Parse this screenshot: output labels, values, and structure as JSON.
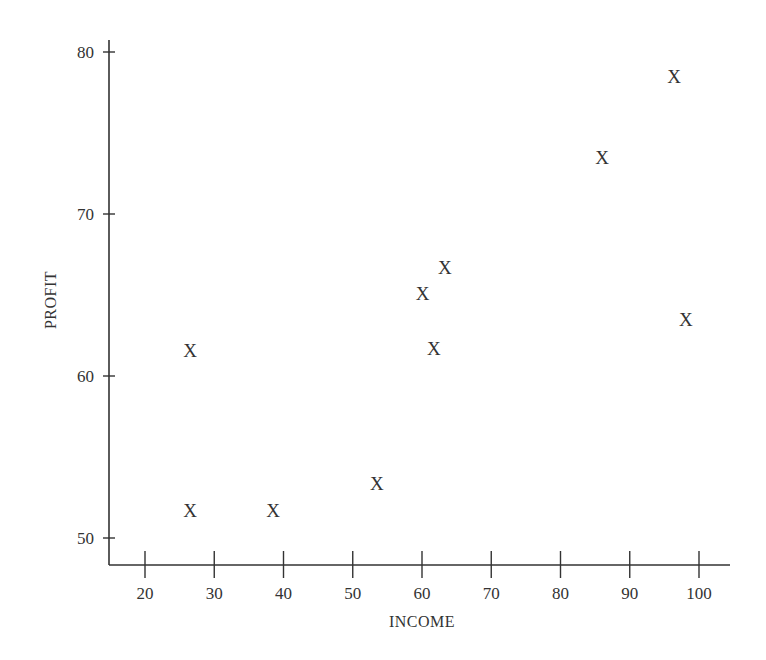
{
  "chart_data": {
    "type": "scatter",
    "title": "",
    "xlabel": "INCOME",
    "ylabel": "PROFIT",
    "xlim": [
      15,
      105
    ],
    "ylim": [
      48.5,
      81
    ],
    "grid": false,
    "legend": null,
    "marker": "X",
    "x_ticks": [
      20,
      30,
      40,
      50,
      60,
      70,
      80,
      90,
      100
    ],
    "y_ticks": [
      50,
      60,
      70,
      80
    ],
    "points": [
      {
        "x": 26.5,
        "y": 61.6
      },
      {
        "x": 26.5,
        "y": 51.7
      },
      {
        "x": 38.5,
        "y": 51.7
      },
      {
        "x": 53.5,
        "y": 53.4
      },
      {
        "x": 60.1,
        "y": 65.1
      },
      {
        "x": 63.3,
        "y": 66.7
      },
      {
        "x": 61.7,
        "y": 61.7
      },
      {
        "x": 86.0,
        "y": 73.5
      },
      {
        "x": 96.4,
        "y": 78.5
      },
      {
        "x": 98.1,
        "y": 63.5
      }
    ]
  }
}
